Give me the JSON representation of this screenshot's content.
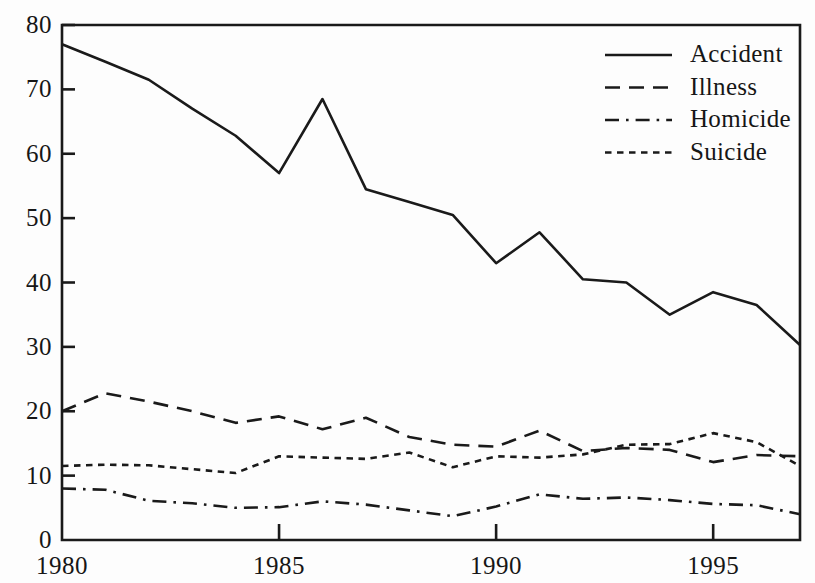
{
  "chart_data": {
    "type": "line",
    "title": "",
    "subtitle": "",
    "xlabel": "",
    "ylabel": "",
    "xlim": [
      1980,
      1997
    ],
    "ylim": [
      0,
      80
    ],
    "grid": false,
    "legend_position": "top-right",
    "x": [
      1980,
      1981,
      1982,
      1983,
      1984,
      1985,
      1986,
      1987,
      1988,
      1989,
      1990,
      1991,
      1992,
      1993,
      1994,
      1995,
      1996,
      1997
    ],
    "x_tick_labels": [
      "1980",
      "1985",
      "1990",
      "1995"
    ],
    "x_tick_values": [
      1980,
      1985,
      1990,
      1995
    ],
    "y_tick_labels": [
      "0",
      "10",
      "20",
      "30",
      "40",
      "50",
      "60",
      "70",
      "80"
    ],
    "y_tick_values": [
      0,
      10,
      20,
      30,
      40,
      50,
      60,
      70,
      80
    ],
    "series": [
      {
        "name": "Accident",
        "style": "solid",
        "values": [
          77.0,
          74.3,
          71.5,
          67.0,
          62.8,
          57.0,
          68.5,
          54.5,
          52.5,
          50.5,
          43.0,
          47.8,
          40.5,
          40.0,
          35.0,
          38.5,
          36.5,
          30.3
        ]
      },
      {
        "name": "Illness",
        "style": "dashed",
        "values": [
          20.0,
          22.8,
          21.5,
          20.0,
          18.2,
          19.2,
          17.2,
          19.0,
          16.0,
          14.8,
          14.5,
          17.0,
          13.8,
          14.3,
          14.0,
          12.1,
          13.2,
          13.0
        ]
      },
      {
        "name": "Homicide",
        "style": "dash-dot",
        "values": [
          8.0,
          7.8,
          6.1,
          5.7,
          5.0,
          5.1,
          6.0,
          5.5,
          4.6,
          3.7,
          5.2,
          7.1,
          6.4,
          6.6,
          6.2,
          5.6,
          5.4,
          4.0
        ]
      },
      {
        "name": "Suicide",
        "style": "dotted",
        "values": [
          11.5,
          11.7,
          11.6,
          11.0,
          10.4,
          13.0,
          12.8,
          12.6,
          13.6,
          11.3,
          13.0,
          12.8,
          13.3,
          14.8,
          14.9,
          16.6,
          15.2,
          11.5
        ]
      }
    ]
  },
  "legend": {
    "items": [
      {
        "label": "Accident",
        "style": "solid"
      },
      {
        "label": "Illness",
        "style": "dashed"
      },
      {
        "label": "Homicide",
        "style": "dash-dot"
      },
      {
        "label": "Suicide",
        "style": "dotted"
      }
    ]
  },
  "axes": {
    "y_labels": [
      "80",
      "70",
      "60",
      "50",
      "40",
      "30",
      "20",
      "10",
      "0"
    ],
    "x_labels": [
      "1980",
      "1985",
      "1990",
      "1995"
    ]
  },
  "colors": {
    "ink": "#1a1a1a",
    "paper": "#fdfdfd"
  }
}
